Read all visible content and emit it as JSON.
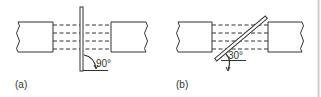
{
  "diagram": {
    "panels": [
      {
        "id": "a",
        "caption": "(a)",
        "angle_label": "90°",
        "plate_orientation": "perpendicular"
      },
      {
        "id": "b",
        "caption": "(b)",
        "angle_label": "30°",
        "plate_orientation": "inclined"
      }
    ],
    "elements": {
      "blocks_per_panel": 2,
      "dashed_lines_per_panel": 4,
      "block_edge_style": "wavy-break-line"
    },
    "colors": {
      "stroke": "#333333",
      "background": "#ffffff",
      "border": "#cccccc"
    }
  }
}
